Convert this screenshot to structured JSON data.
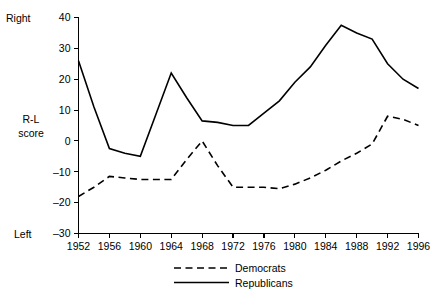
{
  "chart_data": {
    "type": "line",
    "title": "",
    "subtitle": "",
    "xlabel": "",
    "ylabel": "R-L score",
    "ylabel_lines": [
      "R-L",
      "score"
    ],
    "y_top_anchor": "Right",
    "y_bottom_anchor": "Left",
    "xlim": [
      1952,
      1996
    ],
    "ylim": [
      -30,
      40
    ],
    "yticks": [
      -30,
      -20,
      -10,
      0,
      10,
      20,
      30,
      40
    ],
    "ytick_labels": [
      "–30",
      "–20",
      "–10",
      "0",
      "10",
      "20",
      "30",
      "40"
    ],
    "xticks": [
      1952,
      1956,
      1960,
      1964,
      1968,
      1972,
      1976,
      1980,
      1984,
      1988,
      1992,
      1996
    ],
    "xtick_labels": [
      "1952",
      "1956",
      "1960",
      "1964",
      "1968",
      "1972",
      "1976",
      "1980",
      "1984",
      "1988",
      "1992",
      "1996"
    ],
    "grid": false,
    "legend_position": "bottom-center",
    "x": [
      1952,
      1954,
      1956,
      1958,
      1960,
      1962,
      1964,
      1966,
      1968,
      1970,
      1972,
      1974,
      1976,
      1978,
      1980,
      1982,
      1984,
      1986,
      1988,
      1990,
      1992,
      1994,
      1996
    ],
    "series": [
      {
        "name": "Democrats",
        "style": "dashed",
        "color": "#000000",
        "values": [
          -18,
          -15,
          -11.5,
          -12,
          -12.5,
          -12.5,
          -12.5,
          -6,
          0,
          -8,
          -15,
          -15,
          -15,
          -15.5,
          -14,
          -12,
          -9.5,
          -6.5,
          -4,
          -1,
          8,
          7,
          5
        ]
      },
      {
        "name": "Republicans",
        "style": "solid",
        "color": "#000000",
        "values": [
          26,
          11,
          -2.5,
          -4,
          -5,
          8.5,
          22,
          14,
          6.5,
          6,
          5,
          5,
          9,
          13,
          19,
          24,
          31,
          37.5,
          35,
          33,
          25,
          20,
          17
        ]
      }
    ],
    "legend": [
      {
        "label": "Democrats",
        "style": "dashed"
      },
      {
        "label": "Republicans",
        "style": "solid"
      }
    ]
  }
}
